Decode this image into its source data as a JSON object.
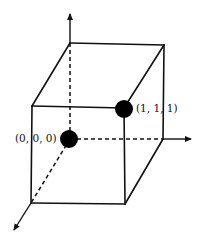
{
  "diagram": {
    "type": "unit-cube-3d",
    "colors": {
      "line": "#111111",
      "point": "#000000",
      "background": "#ffffff"
    },
    "points": [
      {
        "id": "origin",
        "label": "(0, 0, 0)",
        "coords": [
          0,
          0,
          0
        ]
      },
      {
        "id": "opposite",
        "label": "(1, 1, 1)",
        "coords": [
          1,
          1,
          1
        ]
      }
    ],
    "axes": [
      {
        "id": "vertical-axis",
        "direction": "up"
      },
      {
        "id": "horizontal-axis",
        "direction": "right"
      },
      {
        "id": "depth-axis",
        "direction": "down-left"
      }
    ],
    "edges": {
      "solid_count": 9,
      "hidden_dashed_count": 3
    }
  }
}
